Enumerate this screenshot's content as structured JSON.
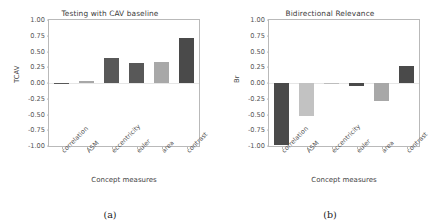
{
  "figure": {
    "background": "#ffffff",
    "axis_color": "#b9b9b9",
    "text_color": "#444444"
  },
  "panels": [
    {
      "caption": "(a)",
      "chart_data": {
        "type": "bar",
        "title": "Testing with CAV baseline",
        "xlabel": "Concept measures",
        "ylabel": "TCAV",
        "categories": [
          "correlation",
          "ASM",
          "eccentricity",
          "euler",
          "area",
          "contrast"
        ],
        "values": [
          0.005,
          0.03,
          0.4,
          0.31,
          0.33,
          0.72
        ],
        "colors": [
          "#585858",
          "#a8a8a8",
          "#585858",
          "#585858",
          "#a8a8a8",
          "#4a4a4a"
        ],
        "ylim": [
          -1.0,
          1.0
        ],
        "yticks": [
          1.0,
          0.75,
          0.5,
          0.25,
          0.0,
          -0.25,
          -0.5,
          -0.75,
          -1.0
        ],
        "ytick_labels": [
          "1.00",
          "0.75",
          "0.50",
          "0.25",
          "0.00",
          "-0.25",
          "-0.50",
          "-0.75",
          "-1.00"
        ],
        "grid": false,
        "legend": "none"
      }
    },
    {
      "caption": "(b)",
      "chart_data": {
        "type": "bar",
        "title": "Bidirectional Relevance",
        "xlabel": "Concept measures",
        "ylabel": "Br",
        "categories": [
          "correlation",
          "ASM",
          "eccentricity",
          "euler",
          "area",
          "contrast"
        ],
        "values": [
          -0.98,
          -0.52,
          -0.005,
          -0.04,
          -0.28,
          0.27
        ],
        "colors": [
          "#4a4a4a",
          "#c2c2c2",
          "#bdbdbd",
          "#4a4a4a",
          "#a8a8a8",
          "#4a4a4a"
        ],
        "ylim": [
          -1.0,
          1.0
        ],
        "yticks": [
          1.0,
          0.75,
          0.5,
          0.25,
          0.0,
          -0.25,
          -0.5,
          -0.75,
          -1.0
        ],
        "ytick_labels": [
          "1.00",
          "0.75",
          "0.50",
          "0.25",
          "0.00",
          "-0.25",
          "-0.50",
          "-0.75",
          "-1.00"
        ],
        "grid": false,
        "legend": "none"
      }
    }
  ]
}
